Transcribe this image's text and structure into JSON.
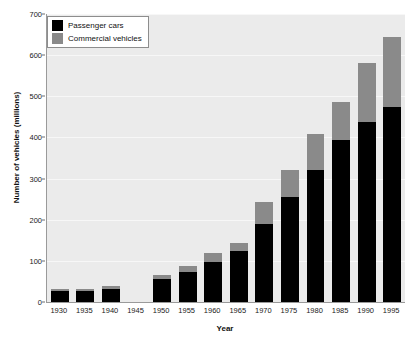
{
  "chart_data": {
    "type": "bar",
    "subtype": "stacked-bar",
    "title": "",
    "xlabel": "Year",
    "ylabel": "Number of vehicles (millions)",
    "categories": [
      "1930",
      "1935",
      "1940",
      "1945",
      "1950",
      "1955",
      "1960",
      "1965",
      "1970",
      "1975",
      "1980",
      "1985",
      "1990",
      "1995"
    ],
    "series": [
      {
        "name": "Passenger cars",
        "color": "#000000",
        "values": [
          27,
          27,
          32,
          null,
          56,
          73,
          98,
          124,
          190,
          256,
          322,
          395,
          437,
          473
        ]
      },
      {
        "name": "Commercial vehicles",
        "color": "#8a8a8a",
        "values": [
          5,
          5,
          8,
          null,
          10,
          15,
          22,
          20,
          52,
          66,
          86,
          90,
          143,
          172
        ]
      }
    ],
    "totals": [
      32,
      32,
      40,
      null,
      66,
      88,
      120,
      144,
      242,
      322,
      408,
      485,
      580,
      645
    ],
    "ylim": [
      0,
      700
    ],
    "yticks": [
      0,
      100,
      200,
      300,
      400,
      500,
      600,
      700
    ],
    "ytick_labels": [
      "0",
      "100",
      "200",
      "300",
      "400",
      "500",
      "600",
      "700"
    ],
    "grid": true,
    "grid_axis": "y",
    "legend_position": "top-left",
    "missing_data_categories": [
      "1945"
    ],
    "plot_background": "#ebebeb",
    "gridline_color": "#f7f7f7",
    "axis_color": "#9a9a9a"
  },
  "legend": {
    "entries": [
      {
        "label": "Passenger cars",
        "swatch": "passenger"
      },
      {
        "label": "Commercial vehicles",
        "swatch": "commercial"
      }
    ]
  }
}
